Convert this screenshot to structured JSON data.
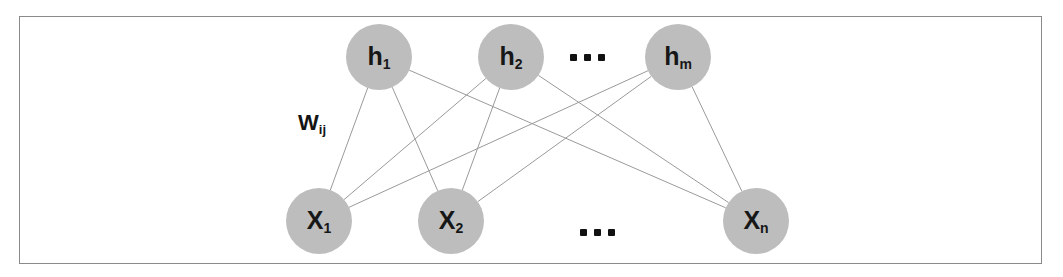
{
  "figure": {
    "type": "neural-network-diagram",
    "background_color": "#ffffff",
    "frame": {
      "x": 19,
      "y": 16,
      "width": 1023,
      "height": 248,
      "border_color": "#8a8a8a",
      "border_width": 1
    },
    "node_fill_color": "#bdbdbd",
    "node_radius": 33,
    "edge_color": "#9a9a9a",
    "edge_width": 1,
    "text_color": "#171717"
  },
  "weight_label": {
    "base": "W",
    "subscript": "ij",
    "x": 298,
    "y": 112
  },
  "layers": [
    {
      "name": "hidden",
      "y": 57,
      "nodes": [
        {
          "id": "h1",
          "base": "h",
          "subscript": "1",
          "cx": 379,
          "cy": 57
        },
        {
          "id": "h2",
          "base": "h",
          "subscript": "2",
          "cx": 511,
          "cy": 57
        },
        {
          "id": "hm",
          "base": "h",
          "subscript": "m",
          "cx": 678,
          "cy": 57
        }
      ],
      "ellipsis": {
        "cx": 587,
        "cy": 58,
        "dots": 3
      }
    },
    {
      "name": "visible",
      "y": 221,
      "nodes": [
        {
          "id": "x1",
          "base": "X",
          "subscript": "1",
          "cx": 319,
          "cy": 221
        },
        {
          "id": "x2",
          "base": "X",
          "subscript": "2",
          "cx": 451,
          "cy": 221
        },
        {
          "id": "xn",
          "base": "X",
          "subscript": "n",
          "cx": 756,
          "cy": 221
        }
      ],
      "ellipsis": {
        "cx": 597,
        "cy": 233,
        "dots": 3
      }
    }
  ],
  "edges": [
    {
      "from": "h1",
      "to": "x1"
    },
    {
      "from": "h1",
      "to": "x2"
    },
    {
      "from": "h1",
      "to": "xn"
    },
    {
      "from": "h2",
      "to": "x1"
    },
    {
      "from": "h2",
      "to": "x2"
    },
    {
      "from": "h2",
      "to": "xn"
    },
    {
      "from": "hm",
      "to": "x1"
    },
    {
      "from": "hm",
      "to": "x2"
    },
    {
      "from": "hm",
      "to": "xn"
    }
  ]
}
